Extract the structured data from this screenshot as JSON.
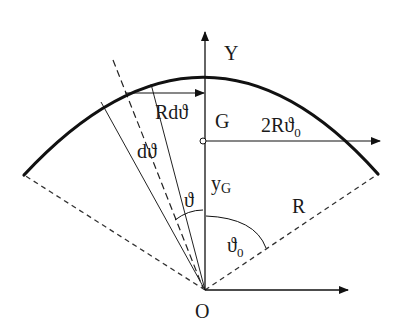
{
  "diagram": {
    "type": "circular-arc-centroid",
    "labels": {
      "y_axis": "Y",
      "origin": "O",
      "centroid": "G",
      "element_length": "Rdϑ",
      "element_angle": "dϑ",
      "angle": "ϑ",
      "half_angle": "ϑ",
      "half_angle_sub": "0",
      "centroid_distance": "y",
      "centroid_distance_sub": "G",
      "radius": "R",
      "chord_length": "2Rϑ",
      "chord_length_sub": "0"
    },
    "colors": {
      "line": "#111111",
      "background": "#ffffff"
    }
  }
}
